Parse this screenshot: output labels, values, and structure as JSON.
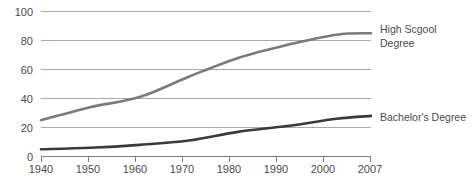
{
  "chart_data": {
    "type": "line",
    "title": "",
    "subtitle": "",
    "xlabel": "",
    "ylabel": "",
    "x": [
      1940,
      1950,
      1960,
      1970,
      1980,
      1990,
      2000,
      2007
    ],
    "xlim": [
      1940,
      2007
    ],
    "ylim": [
      0,
      100
    ],
    "yticks": [
      0,
      20,
      40,
      60,
      80,
      100
    ],
    "xticks": [
      1940,
      1950,
      1960,
      1970,
      1980,
      1990,
      2000,
      2007
    ],
    "grid": true,
    "legend_position": "right-inline-labels",
    "series": [
      {
        "name": "High Scgool Degree",
        "color": "#7a7a7a",
        "values": [
          25,
          34,
          41,
          55,
          68,
          77,
          84,
          85
        ]
      },
      {
        "name": "Bachelor's Degree",
        "color": "#3a3a3a",
        "values": [
          5,
          6,
          8,
          11,
          17,
          21,
          26,
          28
        ]
      }
    ]
  },
  "axis": {
    "y_tick_labels": [
      "100",
      "80",
      "60",
      "40",
      "20",
      "0"
    ],
    "x_tick_labels": [
      "1940",
      "1950",
      "1960",
      "1970",
      "1980",
      "1990",
      "2000",
      "2007"
    ]
  },
  "labels": {
    "highschool_line1": "High Scgool",
    "highschool_line2": "Degree",
    "bachelor": "Bachelor's Degree"
  }
}
